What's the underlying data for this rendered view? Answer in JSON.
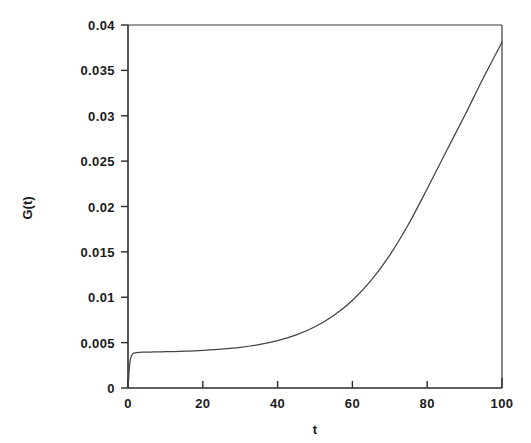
{
  "chart_data": {
    "type": "line",
    "title": "",
    "subtitle": "",
    "xlabel": "t",
    "ylabel": "G(t)",
    "xlim": [
      0,
      100
    ],
    "ylim": [
      0,
      0.04
    ],
    "grid": false,
    "legend": null,
    "x_ticks": [
      0,
      20,
      40,
      60,
      80,
      100
    ],
    "x_tick_labels": [
      "0",
      "20",
      "40",
      "60",
      "80",
      "100"
    ],
    "y_ticks": [
      0,
      0.005,
      0.01,
      0.015,
      0.02,
      0.025,
      0.03,
      0.035,
      0.04
    ],
    "y_tick_labels": [
      "0",
      "0.005",
      "0.01",
      "0.015",
      "0.02",
      "0.025",
      "0.03",
      "0.035",
      "0.04"
    ],
    "series": [
      {
        "name": "G(t)",
        "color": "#434343",
        "x": [
          0,
          0.5,
          1,
          1.5,
          2,
          3,
          4,
          6,
          8,
          10,
          12,
          15,
          18,
          20,
          25,
          30,
          35,
          40,
          45,
          50,
          55,
          60,
          65,
          70,
          75,
          80,
          85,
          90,
          95,
          100
        ],
        "values": [
          0.0,
          0.0028,
          0.0036,
          0.00382,
          0.00388,
          0.00392,
          0.00394,
          0.00396,
          0.00398,
          0.004,
          0.00402,
          0.00406,
          0.0041,
          0.00414,
          0.00428,
          0.00448,
          0.00478,
          0.00522,
          0.00585,
          0.00675,
          0.008,
          0.00965,
          0.01185,
          0.01465,
          0.01805,
          0.02195,
          0.026,
          0.03,
          0.03415,
          0.0381
        ]
      }
    ],
    "annotations": []
  }
}
